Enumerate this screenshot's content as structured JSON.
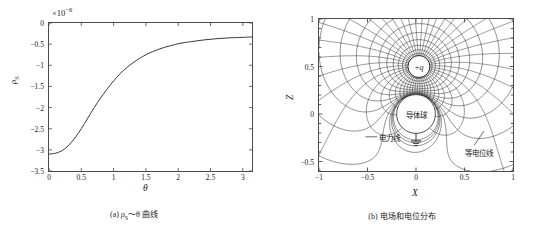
{
  "figure": {
    "panel_a": {
      "caption": "(a) ρS～θ 曲线",
      "caption_prefix": "(a) ",
      "caption_rho": "ρ",
      "caption_sub": "S",
      "caption_rest": "～θ 曲线",
      "exponent_label": "×10",
      "exponent_power": "−6",
      "ylabel": "ρ",
      "ylabel_sub": "S",
      "xlabel": "θ",
      "yticks": [
        "0",
        "−0.5",
        "−1",
        "−1.5",
        "−2",
        "−2.5",
        "−3",
        "−3.5"
      ],
      "xticks": [
        "0",
        "0.5",
        "1",
        "1.5",
        "2",
        "2.5",
        "3"
      ]
    },
    "panel_b": {
      "caption": "(b) 电场和电位分布",
      "xlabel": "X",
      "ylabel": "Z",
      "xticks": [
        "−1",
        "−0.5",
        "0",
        "0.5",
        "1"
      ],
      "yticks": [
        "1",
        "0.5",
        "0",
        "−0.5"
      ],
      "charge_label": "+q",
      "sphere_label": "导体球",
      "fieldline_label": "电力线",
      "equipotential_label": "等电位线",
      "ground_symbol": "ground-symbol"
    }
  },
  "colors": {
    "axis": "#4a4a4a",
    "curve": "#3a3a3a",
    "fieldline": "#2b2b2b",
    "equipotential": "#2b2b2b",
    "text": "#1a1a1a",
    "background": "#ffffff"
  },
  "chart_data": [
    {
      "type": "line",
      "title": "(a) ρS～θ 曲线",
      "xlabel": "θ",
      "ylabel": "ρS",
      "y_scale_exponent": -6,
      "xlim": [
        0,
        3.1416
      ],
      "ylim": [
        -3.5,
        0
      ],
      "xtick_values": [
        0,
        0.5,
        1,
        1.5,
        2,
        2.5,
        3
      ],
      "ytick_values": [
        0,
        -0.5,
        -1,
        -1.5,
        -2,
        -2.5,
        -3,
        -3.5
      ],
      "grid": false,
      "legend": "none",
      "series": [
        {
          "name": "ρS(θ)",
          "x": [
            0,
            0.1,
            0.2,
            0.3,
            0.4,
            0.5,
            0.6,
            0.7,
            0.8,
            0.9,
            1.0,
            1.1,
            1.2,
            1.3,
            1.4,
            1.5,
            1.6,
            1.7,
            1.8,
            1.9,
            2.0,
            2.2,
            2.4,
            2.6,
            2.8,
            3.0,
            3.1416
          ],
          "y": [
            -3.1,
            -3.08,
            -3.02,
            -2.9,
            -2.72,
            -2.5,
            -2.25,
            -2.0,
            -1.77,
            -1.56,
            -1.37,
            -1.2,
            -1.06,
            -0.94,
            -0.84,
            -0.75,
            -0.68,
            -0.62,
            -0.57,
            -0.53,
            -0.49,
            -0.44,
            -0.4,
            -0.37,
            -0.35,
            -0.34,
            -0.33
          ]
        }
      ]
    },
    {
      "type": "scatter",
      "title": "(b) 电场和电位分布",
      "xlabel": "X",
      "ylabel": "Z",
      "xlim": [
        -1,
        1
      ],
      "ylim": [
        -0.6,
        1
      ],
      "xtick_values": [
        -1,
        -0.5,
        0,
        0.5,
        1
      ],
      "ytick_values": [
        1,
        0.5,
        0,
        -0.5
      ],
      "grid": false,
      "legend": "inline-annotations",
      "annotations": [
        {
          "text": "+q",
          "x": 0.03,
          "y": 0.5,
          "kind": "point-charge"
        },
        {
          "text": "导体球",
          "x": 0.0,
          "y": 0.0,
          "kind": "conductor-sphere"
        },
        {
          "text": "电力线",
          "x": -0.38,
          "y": -0.27,
          "kind": "field-line-callout"
        },
        {
          "text": "等电位线",
          "x": 0.72,
          "y": -0.4,
          "kind": "equipotential-callout"
        }
      ],
      "elements": {
        "point_charge": {
          "x": 0.03,
          "y": 0.5,
          "radius_px": 11
        },
        "conductor_sphere": {
          "x": 0.0,
          "y": 0.0,
          "radius": 0.2
        },
        "field_lines_count": 48,
        "equipotential_count": 22
      }
    }
  ]
}
